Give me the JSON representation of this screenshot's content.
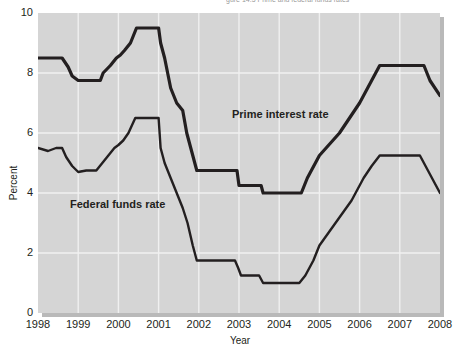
{
  "figure": {
    "top_caption": "gure 14.5  Prime and federal funds rates"
  },
  "axes": {
    "ylabel": "Percent",
    "xlabel": "Year",
    "yticks": [
      0,
      2,
      4,
      6,
      8,
      10
    ],
    "xticks": [
      "1998",
      "1999",
      "2000",
      "2001",
      "2002",
      "2003",
      "2004",
      "2005",
      "2006",
      "2007",
      "2008"
    ]
  },
  "annotations": {
    "prime": "Prime interest rate",
    "federal_funds": "Federal funds rate"
  },
  "style": {
    "plot_background": "#d5d5d5",
    "grid_color": "#f0f0f0",
    "line_color": "#231f20",
    "page_background": "#ffffff",
    "shadow_color": "#b9b9b9"
  },
  "chart_data": {
    "type": "line",
    "title": "Prime and federal funds rates",
    "xlabel": "Year",
    "ylabel": "Percent",
    "xlim": [
      1998,
      2008
    ],
    "ylim": [
      0,
      10
    ],
    "grid": true,
    "legend": "inline-annotations",
    "series": [
      {
        "name": "Prime interest rate",
        "color": "#231f20",
        "points": [
          [
            1998.0,
            8.5
          ],
          [
            1998.6,
            8.5
          ],
          [
            1998.75,
            8.2
          ],
          [
            1998.85,
            7.9
          ],
          [
            1999.0,
            7.75
          ],
          [
            1999.55,
            7.75
          ],
          [
            1999.62,
            8.0
          ],
          [
            1999.8,
            8.25
          ],
          [
            1999.95,
            8.5
          ],
          [
            2000.05,
            8.6
          ],
          [
            2000.15,
            8.75
          ],
          [
            2000.3,
            9.0
          ],
          [
            2000.45,
            9.5
          ],
          [
            2001.0,
            9.5
          ],
          [
            2001.05,
            9.0
          ],
          [
            2001.15,
            8.5
          ],
          [
            2001.3,
            7.5
          ],
          [
            2001.45,
            7.0
          ],
          [
            2001.6,
            6.75
          ],
          [
            2001.7,
            6.0
          ],
          [
            2001.8,
            5.5
          ],
          [
            2001.95,
            4.75
          ],
          [
            2002.05,
            4.75
          ],
          [
            2002.95,
            4.75
          ],
          [
            2003.0,
            4.25
          ],
          [
            2003.1,
            4.25
          ],
          [
            2003.55,
            4.25
          ],
          [
            2003.6,
            4.0
          ],
          [
            2003.7,
            4.0
          ],
          [
            2004.55,
            4.0
          ],
          [
            2004.7,
            4.5
          ],
          [
            2005.0,
            5.25
          ],
          [
            2005.5,
            6.0
          ],
          [
            2006.0,
            7.0
          ],
          [
            2006.3,
            7.75
          ],
          [
            2006.5,
            8.25
          ],
          [
            2006.55,
            8.25
          ],
          [
            2007.6,
            8.25
          ],
          [
            2007.75,
            7.75
          ],
          [
            2008.0,
            7.25
          ]
        ]
      },
      {
        "name": "Federal funds rate",
        "color": "#231f20",
        "points": [
          [
            1998.0,
            5.5
          ],
          [
            1998.25,
            5.4
          ],
          [
            1998.45,
            5.5
          ],
          [
            1998.6,
            5.5
          ],
          [
            1998.7,
            5.2
          ],
          [
            1998.85,
            4.9
          ],
          [
            1999.0,
            4.7
          ],
          [
            1999.2,
            4.75
          ],
          [
            1999.45,
            4.75
          ],
          [
            1999.6,
            5.0
          ],
          [
            1999.75,
            5.25
          ],
          [
            1999.9,
            5.5
          ],
          [
            2000.0,
            5.6
          ],
          [
            2000.12,
            5.75
          ],
          [
            2000.25,
            6.0
          ],
          [
            2000.42,
            6.5
          ],
          [
            2000.5,
            6.5
          ],
          [
            2001.0,
            6.5
          ],
          [
            2001.05,
            5.5
          ],
          [
            2001.15,
            5.0
          ],
          [
            2001.3,
            4.5
          ],
          [
            2001.45,
            4.0
          ],
          [
            2001.6,
            3.5
          ],
          [
            2001.72,
            3.0
          ],
          [
            2001.85,
            2.25
          ],
          [
            2001.95,
            1.75
          ],
          [
            2002.05,
            1.75
          ],
          [
            2002.9,
            1.75
          ],
          [
            2002.98,
            1.5
          ],
          [
            2003.05,
            1.25
          ],
          [
            2003.2,
            1.25
          ],
          [
            2003.5,
            1.25
          ],
          [
            2003.6,
            1.0
          ],
          [
            2003.75,
            1.0
          ],
          [
            2004.5,
            1.0
          ],
          [
            2004.65,
            1.25
          ],
          [
            2004.85,
            1.75
          ],
          [
            2005.0,
            2.25
          ],
          [
            2005.4,
            3.0
          ],
          [
            2005.8,
            3.75
          ],
          [
            2006.1,
            4.5
          ],
          [
            2006.3,
            4.9
          ],
          [
            2006.5,
            5.25
          ],
          [
            2006.6,
            5.25
          ],
          [
            2007.5,
            5.25
          ],
          [
            2007.7,
            4.75
          ],
          [
            2007.9,
            4.25
          ],
          [
            2008.0,
            4.0
          ]
        ]
      }
    ]
  }
}
